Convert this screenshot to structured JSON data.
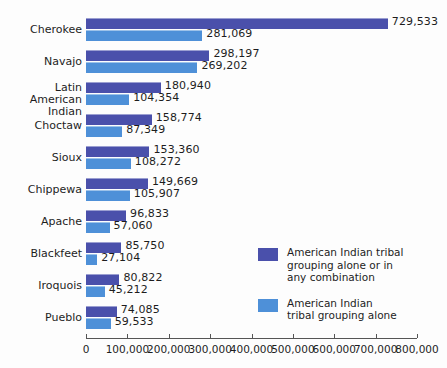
{
  "chart_data": {
    "type": "bar",
    "orientation": "horizontal",
    "title": "",
    "xlabel": "",
    "ylabel": "",
    "xlim": [
      0,
      800000
    ],
    "grid": false,
    "legend_position": "inside-right-lower",
    "categories": [
      "Cherokee",
      "Navajo",
      "Latin American Indian",
      "Choctaw",
      "Sioux",
      "Chippewa",
      "Apache",
      "Blackfeet",
      "Iroquois",
      "Pueblo"
    ],
    "category_label_lines": [
      [
        "Cherokee"
      ],
      [
        "Navajo"
      ],
      [
        "Latin American",
        "Indian"
      ],
      [
        "Choctaw"
      ],
      [
        "Sioux"
      ],
      [
        "Chippewa"
      ],
      [
        "Apache"
      ],
      [
        "Blackfeet"
      ],
      [
        "Iroquois"
      ],
      [
        "Pueblo"
      ]
    ],
    "series": [
      {
        "name": "American Indian tribal grouping alone or in any combination",
        "color": "#4a50ab",
        "values": [
          729533,
          298197,
          180940,
          158774,
          153360,
          149669,
          96833,
          85750,
          80822,
          74085
        ],
        "value_labels": [
          "729,533",
          "298,197",
          "180,940",
          "158,774",
          "153,360",
          "149,669",
          "96,833",
          "85,750",
          "80,822",
          "74,085"
        ]
      },
      {
        "name": "American Indian tribal grouping alone",
        "color": "#4e90d8",
        "values": [
          281069,
          269202,
          104354,
          87349,
          108272,
          105907,
          57060,
          27104,
          45212,
          59533
        ],
        "value_labels": [
          "281,069",
          "269,202",
          "104,354",
          "87,349",
          "108,272",
          "105,907",
          "57,060",
          "27,104",
          "45,212",
          "59,533"
        ]
      }
    ],
    "xticks": [
      0,
      100000,
      200000,
      300000,
      400000,
      500000,
      600000,
      700000,
      800000
    ],
    "xtick_labels": [
      "0",
      "100,000",
      "200,000",
      "300,000",
      "400,000",
      "500,000",
      "600,000",
      "700,000",
      "800,000"
    ]
  },
  "legend": {
    "items": [
      {
        "color": "#4a50ab",
        "lines": [
          "American Indian tribal",
          "grouping alone or in",
          "any combination"
        ]
      },
      {
        "color": "#4e90d8",
        "lines": [
          "American Indian",
          "tribal grouping alone"
        ]
      }
    ]
  }
}
